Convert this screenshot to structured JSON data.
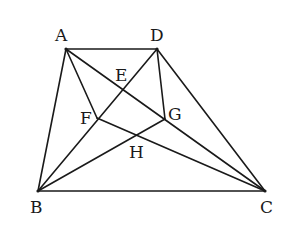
{
  "diagram": {
    "type": "geometry",
    "stroke_color": "#1a1a1a",
    "points": {
      "A": {
        "label": "A",
        "x": 66,
        "y": 49,
        "label_x": 55,
        "label_y": 27
      },
      "D": {
        "label": "D",
        "x": 157,
        "y": 49,
        "label_x": 150,
        "label_y": 27
      },
      "B": {
        "label": "B",
        "x": 38,
        "y": 191,
        "label_x": 30,
        "label_y": 199
      },
      "C": {
        "label": "C",
        "x": 265,
        "y": 191,
        "label_x": 260,
        "label_y": 199
      },
      "E": {
        "label": "E",
        "x": 123,
        "y": 89,
        "label_x": 115,
        "label_y": 67
      },
      "F": {
        "label": "F",
        "x": 97,
        "y": 118,
        "label_x": 80,
        "label_y": 110
      },
      "G": {
        "label": "G",
        "x": 165,
        "y": 119,
        "label_x": 168,
        "label_y": 106
      },
      "H": {
        "label": "H",
        "x": 137,
        "y": 137,
        "label_x": 129,
        "label_y": 144
      }
    },
    "segments": [
      [
        "A",
        "D"
      ],
      [
        "A",
        "B"
      ],
      [
        "B",
        "C"
      ],
      [
        "D",
        "C"
      ],
      [
        "A",
        "C"
      ],
      [
        "D",
        "B"
      ],
      [
        "A",
        "F"
      ],
      [
        "F",
        "C"
      ],
      [
        "D",
        "G"
      ],
      [
        "B",
        "G"
      ]
    ]
  }
}
